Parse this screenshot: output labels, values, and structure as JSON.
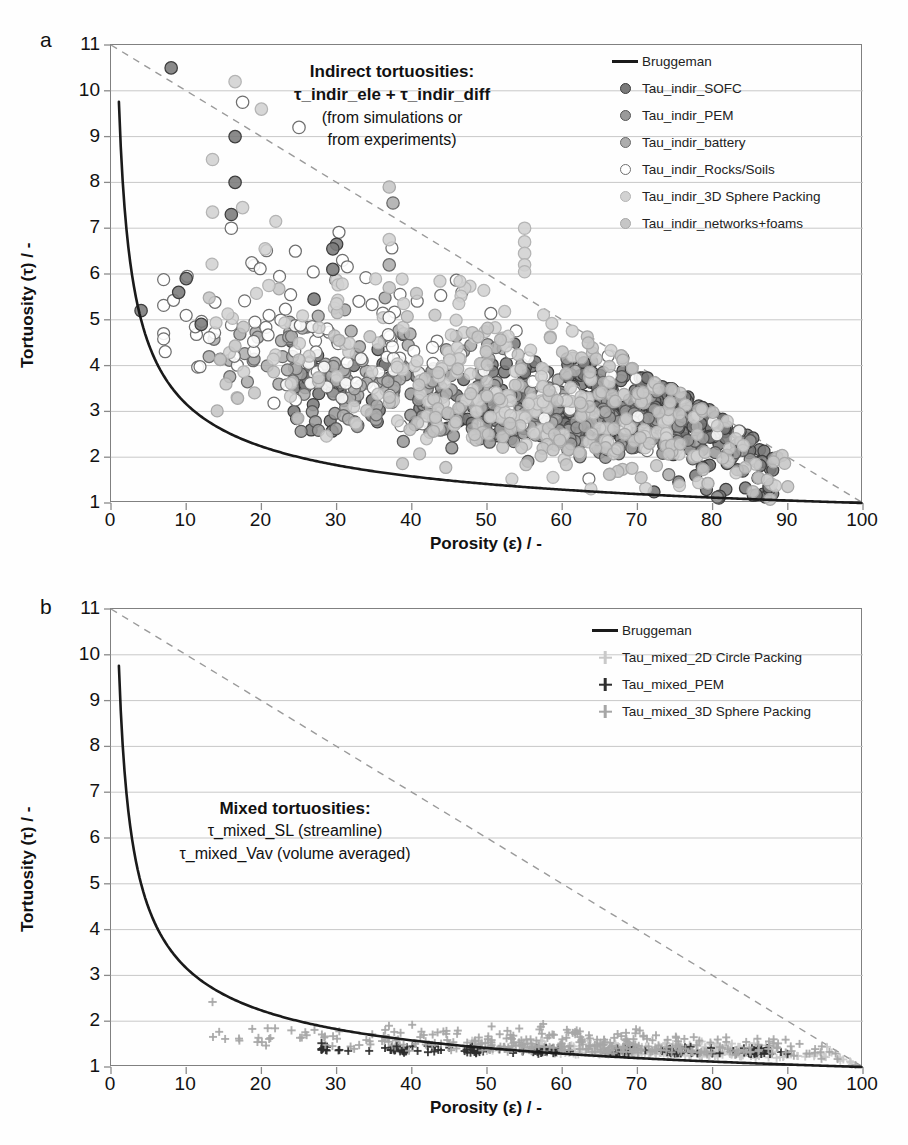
{
  "figure": {
    "background": "#fefefe",
    "panels": [
      "a",
      "b"
    ]
  },
  "panel_a": {
    "letter": "a",
    "annotation": {
      "line1": "Indirect tortuosities:",
      "line2": "τ_indir_ele + τ_indir_diff",
      "line3": "(from simulations or",
      "line4": "from experiments)"
    },
    "legend": [
      {
        "label": "Bruggeman",
        "marker": "line",
        "color": "#1a1a1a",
        "edge": "#1a1a1a"
      },
      {
        "label": "Tau_indir_SOFC",
        "marker": "circle",
        "color": "#7a7a7a",
        "edge": "#3d3d3d"
      },
      {
        "label": "Tau_indir_PEM",
        "marker": "circle",
        "color": "#9a9a9a",
        "edge": "#555555"
      },
      {
        "label": "Tau_indir_battery",
        "marker": "circle",
        "color": "#adadad",
        "edge": "#6a6a6a"
      },
      {
        "label": "Tau_indir_Rocks/Soils",
        "marker": "circle",
        "color": "#ffffff",
        "edge": "#6f6f6f"
      },
      {
        "label": "Tau_indir_3D Sphere Packing",
        "marker": "circle",
        "color": "#d2d2d2",
        "edge": "#b4b4b4"
      },
      {
        "label": "Tau_indir_networks+foams",
        "marker": "circle",
        "color": "#c6c6c6",
        "edge": "#a8a8a8"
      }
    ]
  },
  "panel_b": {
    "letter": "b",
    "annotation": {
      "line1": "Mixed tortuosities:",
      "line2": "τ_mixed_SL (streamline)",
      "line3": "τ_mixed_Vav (volume averaged)"
    },
    "legend": [
      {
        "label": "Bruggeman",
        "marker": "line",
        "color": "#1a1a1a",
        "edge": "#1a1a1a"
      },
      {
        "label": "Tau_mixed_2D Circle Packing",
        "marker": "plus",
        "color": "#c9c9c9",
        "edge": "#c9c9c9"
      },
      {
        "label": "Tau_mixed_PEM",
        "marker": "plus",
        "color": "#2e2e2e",
        "edge": "#2e2e2e"
      },
      {
        "label": "Tau_mixed_3D Sphere Packing",
        "marker": "plus",
        "color": "#a6a6a6",
        "edge": "#a6a6a6"
      }
    ]
  },
  "axes": {
    "xlabel": "Porosity (ε) / -",
    "ylabel": "Tortuosity (τ) / -",
    "xticks": [
      0,
      10,
      20,
      30,
      40,
      50,
      60,
      70,
      80,
      90,
      100
    ],
    "yticks": [
      1,
      2,
      3,
      4,
      5,
      6,
      7,
      8,
      9,
      10,
      11
    ],
    "xlim": [
      0,
      100
    ],
    "ylim": [
      1,
      11
    ],
    "grid": "horizontal"
  },
  "chart_data": [
    {
      "id": "panel_a",
      "type": "scatter",
      "title": "Indirect tortuosities: τ_indir_ele + τ_indir_diff (from simulations or from experiments)",
      "xlabel": "Porosity (ε) / -",
      "ylabel": "Tortuosity (τ) / -",
      "xlim": [
        0,
        100
      ],
      "ylim": [
        1,
        11
      ],
      "xticks": [
        0,
        10,
        20,
        30,
        40,
        50,
        60,
        70,
        80,
        90,
        100
      ],
      "yticks": [
        1,
        2,
        3,
        4,
        5,
        6,
        7,
        8,
        9,
        10,
        11
      ],
      "grid": "horizontal gridlines at each integer tortuosity",
      "legend_position": "top-right inside axes",
      "curves": [
        {
          "name": "Bruggeman",
          "type": "line",
          "style": "solid",
          "color": "#1a1a1a",
          "formula": "tau = eps^-0.5 (eps as fraction)",
          "sample_points": [
            [
              0.5,
              11.0
            ],
            [
              1,
              10.0
            ],
            [
              2,
              7.07
            ],
            [
              3,
              5.77
            ],
            [
              4,
              5.0
            ],
            [
              5,
              4.47
            ],
            [
              7,
              3.78
            ],
            [
              10,
              3.16
            ],
            [
              14,
              2.67
            ],
            [
              20,
              2.24
            ],
            [
              27,
              1.92
            ],
            [
              35,
              1.69
            ],
            [
              45,
              1.49
            ],
            [
              55,
              1.35
            ],
            [
              65,
              1.24
            ],
            [
              75,
              1.15
            ],
            [
              85,
              1.08
            ],
            [
              95,
              1.03
            ],
            [
              100,
              1.0
            ]
          ]
        },
        {
          "name": "diagonal-reference",
          "type": "line",
          "style": "dashed",
          "color": "#9a9a9a",
          "sample_points": [
            [
              0,
              11.0
            ],
            [
              100,
              1.0
            ]
          ]
        }
      ],
      "series": [
        {
          "name": "Tau_indir_SOFC",
          "marker": "circle",
          "fill": "#7a7a7a",
          "edge": "#3d3d3d",
          "n_points": 420,
          "x_range": [
            24,
            88
          ],
          "y_range": [
            1.1,
            5.5
          ],
          "density_peak_x": 66,
          "density_peak_y": 2.3,
          "description": "dense dark cluster between 58-80% porosity, tortuosity 1.5-3.5"
        },
        {
          "name": "Tau_indir_PEM",
          "marker": "circle",
          "fill": "#9a9a9a",
          "edge": "#555555",
          "n_points": 180,
          "x_range": [
            25,
            85
          ],
          "y_range": [
            1.1,
            5.0
          ],
          "density_peak_x": 62,
          "density_peak_y": 2.0
        },
        {
          "name": "Tau_indir_battery",
          "marker": "circle",
          "fill": "#adadad",
          "edge": "#6a6a6a",
          "n_points": 150,
          "x_range": [
            13,
            80
          ],
          "y_range": [
            1.1,
            6.7
          ],
          "density_peak_x": 40,
          "density_peak_y": 2.4
        },
        {
          "name": "Tau_indir_Rocks/Soils",
          "marker": "circle",
          "fill": "#ffffff",
          "edge": "#6f6f6f",
          "n_points": 130,
          "x_range": [
            7,
            85
          ],
          "y_range": [
            1.2,
            9.2
          ],
          "density_peak_x": 35,
          "density_peak_y": 2.6
        },
        {
          "name": "Tau_indir_3D Sphere Packing",
          "marker": "circle",
          "fill": "#d2d2d2",
          "edge": "#b4b4b4",
          "n_points": 190,
          "x_range": [
            13,
            90
          ],
          "y_range": [
            1.05,
            10.5
          ],
          "density_peak_x": 55,
          "density_peak_y": 1.5
        },
        {
          "name": "Tau_indir_networks+foams",
          "marker": "circle",
          "fill": "#c6c6c6",
          "edge": "#a8a8a8",
          "n_points": 160,
          "x_range": [
            13,
            90
          ],
          "y_range": [
            1.05,
            8.6
          ],
          "density_peak_x": 60,
          "density_peak_y": 1.45
        }
      ],
      "notable_outliers": [
        {
          "x": 8,
          "y": 10.5,
          "series": "Tau_indir_SOFC"
        },
        {
          "x": 16.5,
          "y": 10.2,
          "series": "Tau_indir_3D Sphere Packing"
        },
        {
          "x": 17.5,
          "y": 9.75,
          "series": "Tau_indir_Rocks/Soils"
        },
        {
          "x": 20,
          "y": 9.6,
          "series": "Tau_indir_3D Sphere Packing"
        },
        {
          "x": 25,
          "y": 9.2,
          "series": "Tau_indir_Rocks/Soils"
        },
        {
          "x": 16.5,
          "y": 9.0,
          "series": "Tau_indir_SOFC"
        },
        {
          "x": 13.5,
          "y": 8.5,
          "series": "Tau_indir_3D Sphere Packing"
        },
        {
          "x": 16.5,
          "y": 8.0,
          "series": "Tau_indir_SOFC"
        },
        {
          "x": 37,
          "y": 7.9,
          "series": "Tau_indir_networks+foams"
        },
        {
          "x": 37.5,
          "y": 7.55,
          "series": "Tau_indir_battery"
        },
        {
          "x": 17.5,
          "y": 7.45,
          "series": "Tau_indir_3D Sphere Packing"
        },
        {
          "x": 13.5,
          "y": 7.35,
          "series": "Tau_indir_3D Sphere Packing"
        },
        {
          "x": 16.0,
          "y": 7.3,
          "series": "Tau_indir_SOFC"
        },
        {
          "x": 16.0,
          "y": 7.0,
          "series": "Tau_indir_Rocks/Soils"
        },
        {
          "x": 55,
          "y": 7.0,
          "series": "Tau_indir_3D Sphere Packing"
        },
        {
          "x": 55,
          "y": 6.7,
          "series": "Tau_indir_3D Sphere Packing"
        },
        {
          "x": 55,
          "y": 6.45,
          "series": "Tau_indir_3D Sphere Packing"
        },
        {
          "x": 55,
          "y": 6.2,
          "series": "Tau_indir_3D Sphere Packing"
        },
        {
          "x": 55,
          "y": 6.05,
          "series": "Tau_indir_3D Sphere Packing"
        },
        {
          "x": 30,
          "y": 6.65,
          "series": "Tau_indir_SOFC"
        },
        {
          "x": 29.5,
          "y": 6.55,
          "series": "Tau_indir_SOFC"
        },
        {
          "x": 37,
          "y": 6.75,
          "series": "Tau_indir_3D Sphere Packing"
        },
        {
          "x": 20.5,
          "y": 6.55,
          "series": "Tau_indir_3D Sphere Packing"
        },
        {
          "x": 10,
          "y": 5.9,
          "series": "Tau_indir_SOFC"
        },
        {
          "x": 29.5,
          "y": 6.1,
          "series": "Tau_indir_SOFC"
        },
        {
          "x": 37,
          "y": 6.2,
          "series": "Tau_indir_battery"
        },
        {
          "x": 4,
          "y": 5.2,
          "series": "Tau_indir_SOFC"
        },
        {
          "x": 9,
          "y": 5.6,
          "series": "Tau_indir_SOFC"
        },
        {
          "x": 37,
          "y": 5.7,
          "series": "Tau_indir_networks+foams"
        },
        {
          "x": 21,
          "y": 5.75,
          "series": "Tau_indir_3D Sphere Packing"
        },
        {
          "x": 12,
          "y": 4.9,
          "series": "Tau_indir_SOFC"
        },
        {
          "x": 37,
          "y": 5.05,
          "series": "Tau_indir_Rocks/Soils"
        },
        {
          "x": 30,
          "y": 5.35,
          "series": "Tau_indir_3D Sphere Packing"
        },
        {
          "x": 27,
          "y": 5.45,
          "series": "Tau_indir_SOFC"
        }
      ]
    },
    {
      "id": "panel_b",
      "type": "scatter",
      "title": "Mixed tortuosities: τ_mixed_SL (streamline), τ_mixed_Vav (volume averaged)",
      "xlabel": "Porosity (ε) / -",
      "ylabel": "Tortuosity (τ) / -",
      "xlim": [
        0,
        100
      ],
      "ylim": [
        1,
        11
      ],
      "xticks": [
        0,
        10,
        20,
        30,
        40,
        50,
        60,
        70,
        80,
        90,
        100
      ],
      "yticks": [
        1,
        2,
        3,
        4,
        5,
        6,
        7,
        8,
        9,
        10,
        11
      ],
      "grid": "horizontal gridlines at each integer tortuosity",
      "legend_position": "top-right inside axes",
      "curves": [
        {
          "name": "Bruggeman",
          "type": "line",
          "style": "solid",
          "color": "#1a1a1a",
          "formula": "tau = eps^-0.5 (eps as fraction)",
          "sample_points": [
            [
              0.5,
              11.0
            ],
            [
              1,
              10.0
            ],
            [
              2,
              7.07
            ],
            [
              3,
              5.77
            ],
            [
              4,
              5.0
            ],
            [
              5,
              4.47
            ],
            [
              7,
              3.78
            ],
            [
              10,
              3.16
            ],
            [
              14,
              2.67
            ],
            [
              20,
              2.24
            ],
            [
              27,
              1.92
            ],
            [
              35,
              1.69
            ],
            [
              45,
              1.49
            ],
            [
              55,
              1.35
            ],
            [
              65,
              1.24
            ],
            [
              75,
              1.15
            ],
            [
              85,
              1.08
            ],
            [
              95,
              1.03
            ],
            [
              100,
              1.0
            ]
          ]
        },
        {
          "name": "diagonal-reference",
          "type": "line",
          "style": "dashed",
          "color": "#9a9a9a",
          "sample_points": [
            [
              0,
              11.0
            ],
            [
              100,
              1.0
            ]
          ]
        }
      ],
      "series": [
        {
          "name": "Tau_mixed_2D Circle Packing",
          "marker": "plus",
          "fill": "#c9c9c9",
          "edge": "#c9c9c9",
          "n_points": 260,
          "x_range": [
            48,
            99
          ],
          "y_range": [
            1.02,
            1.85
          ],
          "density_peak_x": 72,
          "density_peak_y": 1.2
        },
        {
          "name": "Tau_mixed_PEM",
          "marker": "plus",
          "fill": "#2e2e2e",
          "edge": "#2e2e2e",
          "n_points": 150,
          "x_range": [
            28,
            90
          ],
          "y_range": [
            1.1,
            1.62
          ],
          "density_peak_x": 70,
          "density_peak_y": 1.28,
          "column_positions": [
            28,
            38,
            48,
            58,
            68,
            76,
            86
          ]
        },
        {
          "name": "Tau_mixed_3D Sphere Packing",
          "marker": "plus",
          "fill": "#a6a6a6",
          "edge": "#a6a6a6",
          "n_points": 320,
          "x_range": [
            13.5,
            99
          ],
          "y_range": [
            1.02,
            2.45
          ],
          "density_peak_x": 62,
          "density_peak_y": 1.25
        }
      ],
      "notable_outliers": [
        {
          "x": 13.5,
          "y": 2.42,
          "series": "Tau_mixed_3D Sphere Packing"
        },
        {
          "x": 24,
          "y": 1.8,
          "series": "Tau_mixed_3D Sphere Packing"
        },
        {
          "x": 28,
          "y": 1.52,
          "series": "Tau_mixed_PEM"
        },
        {
          "x": 33,
          "y": 1.48,
          "series": "Tau_mixed_3D Sphere Packing"
        },
        {
          "x": 38,
          "y": 1.45,
          "series": "Tau_mixed_PEM"
        },
        {
          "x": 57,
          "y": 1.82,
          "series": "Tau_mixed_3D Sphere Packing"
        }
      ]
    }
  ]
}
